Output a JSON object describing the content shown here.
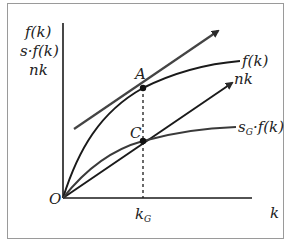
{
  "diagram": {
    "type": "solow-growth-model",
    "y_axis_labels": [
      "f(k)",
      "s·f(k)",
      "nk"
    ],
    "x_axis_label": "k",
    "origin_label": "O",
    "curves": [
      {
        "name": "production-function",
        "label": "f(k)"
      },
      {
        "name": "savings-function",
        "label_main": "s",
        "label_sub": "G",
        "label_rest": "·f(k)"
      },
      {
        "name": "depreciation-line",
        "label": "nk"
      },
      {
        "name": "tangent-line",
        "label": ""
      }
    ],
    "points": [
      {
        "name": "A",
        "label": "A"
      },
      {
        "name": "C",
        "label": "C"
      }
    ],
    "x_tick": {
      "label_main": "k",
      "label_sub": "G"
    },
    "colors": {
      "curve": "#1a1a1a",
      "tangent": "#444444",
      "savings": "#3a3a3a",
      "frame": "#9a9a9a"
    }
  }
}
